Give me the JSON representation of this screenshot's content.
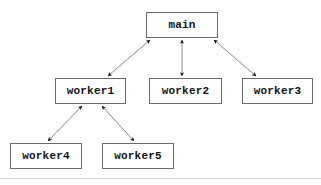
{
  "diagram": {
    "title": "",
    "background_color": "#ffffff",
    "box_border_color": "#6b6b6b",
    "box_fill_color": "#ffffff",
    "edge_color": "#8a8a8a",
    "arrowhead_color": "#111111",
    "text_color": "#111111",
    "nodes": [
      {
        "id": "main",
        "label": "main",
        "x": 146,
        "y": 12,
        "w": 72,
        "h": 26
      },
      {
        "id": "worker1",
        "label": "worker1",
        "x": 55,
        "y": 78,
        "w": 71,
        "h": 26
      },
      {
        "id": "worker2",
        "label": "worker2",
        "x": 149,
        "y": 78,
        "w": 73,
        "h": 26
      },
      {
        "id": "worker3",
        "label": "worker3",
        "x": 242,
        "y": 78,
        "w": 71,
        "h": 26
      },
      {
        "id": "worker4",
        "label": "worker4",
        "x": 10,
        "y": 143,
        "w": 72,
        "h": 26
      },
      {
        "id": "worker5",
        "label": "worker5",
        "x": 102,
        "y": 143,
        "w": 72,
        "h": 26
      }
    ],
    "edges": [
      {
        "id": "main-worker1",
        "from": "main",
        "to": "worker1",
        "direction": "bidirectional",
        "x1": 150,
        "y1": 40,
        "x2": 108,
        "y2": 76
      },
      {
        "id": "main-worker2",
        "from": "main",
        "to": "worker2",
        "direction": "bidirectional",
        "x1": 182,
        "y1": 40,
        "x2": 182,
        "y2": 76
      },
      {
        "id": "main-worker3",
        "from": "main",
        "to": "worker3",
        "direction": "bidirectional",
        "x1": 214,
        "y1": 40,
        "x2": 256,
        "y2": 76
      },
      {
        "id": "worker1-worker4",
        "from": "worker1",
        "to": "worker4",
        "direction": "bidirectional",
        "x1": 82,
        "y1": 106,
        "x2": 48,
        "y2": 141
      },
      {
        "id": "worker1-worker5",
        "from": "worker1",
        "to": "worker5",
        "direction": "bidirectional",
        "x1": 102,
        "y1": 106,
        "x2": 134,
        "y2": 141
      }
    ],
    "artifacts": [
      {
        "id": "page-edge-line",
        "y": 178
      }
    ]
  }
}
